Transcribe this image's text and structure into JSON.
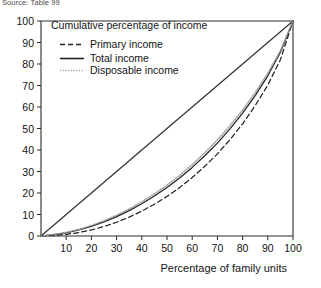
{
  "source_note": "Source: Table 99",
  "legend": {
    "title": "Cumulative percentage of income",
    "entries": [
      {
        "label": "Primary income",
        "style": "dashed",
        "key": "primary"
      },
      {
        "label": "Total income",
        "style": "solid",
        "key": "total"
      },
      {
        "label": "Disposable income",
        "style": "dotted",
        "key": "disposable"
      }
    ]
  },
  "axes": {
    "x_title": "Percentage of family units",
    "x_ticks": [
      "10",
      "20",
      "30",
      "40",
      "50",
      "60",
      "70",
      "80",
      "90",
      "100"
    ],
    "y_ticks": [
      "0",
      "10",
      "20",
      "30",
      "40",
      "50",
      "60",
      "70",
      "80",
      "90",
      "100"
    ]
  },
  "chart_data": {
    "type": "line",
    "title": "Cumulative percentage of income",
    "xlabel": "Percentage of family units",
    "ylabel": "Cumulative percentage of income",
    "xlim": [
      0,
      100
    ],
    "ylim": [
      0,
      100
    ],
    "grid": false,
    "legend_position": "top-left",
    "x": [
      0,
      5,
      10,
      15,
      20,
      25,
      30,
      35,
      40,
      45,
      50,
      55,
      60,
      65,
      70,
      75,
      80,
      85,
      90,
      95,
      100
    ],
    "series": [
      {
        "name": "Line of equality",
        "style": "solid",
        "color": "#333333",
        "in_legend": false,
        "values": [
          0,
          5,
          10,
          15,
          20,
          25,
          30,
          35,
          40,
          45,
          50,
          55,
          60,
          65,
          70,
          75,
          80,
          85,
          90,
          95,
          100
        ]
      },
      {
        "name": "Primary income",
        "style": "dashed",
        "color": "#222222",
        "in_legend": true,
        "values": [
          0,
          0.3,
          0.8,
          1.6,
          2.8,
          4.4,
          6.4,
          8.8,
          11.6,
          14.8,
          18.4,
          22.5,
          27.2,
          32.4,
          38.2,
          44.8,
          52.2,
          60.6,
          70.2,
          82.0,
          100
        ]
      },
      {
        "name": "Total income",
        "style": "solid",
        "color": "#222222",
        "in_legend": true,
        "values": [
          0,
          0.6,
          1.5,
          2.8,
          4.5,
          6.6,
          9.0,
          11.8,
          15.0,
          18.6,
          22.6,
          27.0,
          31.9,
          37.3,
          43.2,
          49.8,
          57.1,
          65.3,
          74.5,
          85.5,
          100
        ]
      },
      {
        "name": "Disposable income",
        "style": "dotted",
        "color": "#9a9a9a",
        "in_legend": true,
        "values": [
          0,
          0.7,
          1.7,
          3.1,
          4.9,
          7.1,
          9.7,
          12.6,
          15.9,
          19.6,
          23.7,
          28.2,
          33.2,
          38.7,
          44.7,
          51.3,
          58.6,
          66.7,
          75.7,
          86.2,
          100
        ]
      }
    ]
  }
}
